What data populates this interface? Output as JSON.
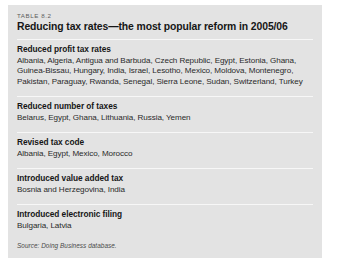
{
  "table": {
    "number_label": "TABLE 8.2",
    "title": "Reducing tax rates—the most popular reform in 2005/06",
    "sections": [
      {
        "heading": "Reduced profit tax rates",
        "body": "Albania, Algeria, Antigua and Barbuda, Czech Republic, Egypt, Estonia, Ghana, Guinea-Bissau, Hungary, India, Israel, Lesotho, Mexico, Moldova, Montenegro, Pakistan, Paraguay, Rwanda, Senegal, Sierra Leone, Sudan, Switzerland, Turkey"
      },
      {
        "heading": "Reduced number of taxes",
        "body": "Belarus, Egypt, Ghana, Lithuania, Russia, Yemen"
      },
      {
        "heading": "Revised tax code",
        "body": "Albania, Egypt, Mexico, Morocco"
      },
      {
        "heading": "Introduced value added tax",
        "body": "Bosnia and Herzegovina, India"
      },
      {
        "heading": "Introduced electronic filing",
        "body": "Bulgaria, Latvia"
      }
    ],
    "source": {
      "label": "Source:",
      "database": "Doing Business",
      "suffix": "database."
    }
  },
  "colors": {
    "card_background": "#e3e3e3",
    "page_background": "#ffffff",
    "rule": "#f7f7f7",
    "heading_text": "#161616",
    "body_text": "#2a2a2a",
    "muted_text": "#5d5d5d"
  }
}
